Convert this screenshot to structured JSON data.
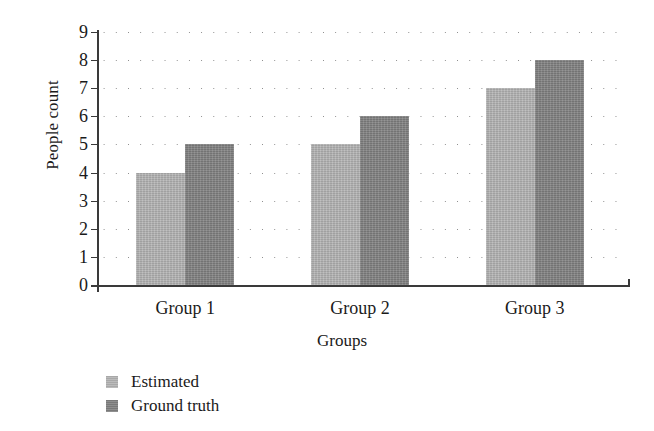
{
  "chart_data": {
    "type": "bar",
    "title": "",
    "subtitle": "",
    "xlabel": "Groups",
    "ylabel": "People count",
    "categories": [
      "Group 1",
      "Group 2",
      "Group 3"
    ],
    "series": [
      {
        "name": "Estimated",
        "values": [
          4,
          5,
          7
        ],
        "color": "#b2b2b2"
      },
      {
        "name": "Ground truth",
        "values": [
          5,
          6,
          8
        ],
        "color": "#828282"
      }
    ],
    "ylim": [
      0,
      9
    ],
    "yticks": [
      0,
      1,
      2,
      3,
      4,
      5,
      6,
      7,
      8,
      9
    ],
    "ytick_labels": [
      "0",
      "1",
      "2",
      "3",
      "4",
      "5",
      "6",
      "7",
      "8",
      "9"
    ],
    "grid": "horizontal-dotted",
    "legend_position": "below-axis-left",
    "legend_entries": [
      "Estimated",
      "Ground truth"
    ],
    "annotations": []
  }
}
